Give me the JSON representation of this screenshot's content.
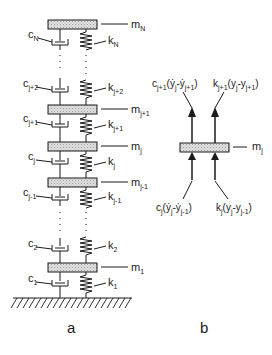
{
  "figure": {
    "panel_a": {
      "caption": "a",
      "masses": [
        {
          "base": "m",
          "sub": "N"
        },
        {
          "base": "m",
          "sub": "j+1"
        },
        {
          "base": "m",
          "sub": "j"
        },
        {
          "base": "m",
          "sub": "j-1"
        },
        {
          "base": "m",
          "sub": "1"
        }
      ],
      "dampers": [
        {
          "base": "c",
          "sub": "N"
        },
        {
          "base": "c",
          "sub": "j+2"
        },
        {
          "base": "c",
          "sub": "j+1"
        },
        {
          "base": "c",
          "sub": "j"
        },
        {
          "base": "c",
          "sub": "j-1"
        },
        {
          "base": "c",
          "sub": "2"
        },
        {
          "base": "c",
          "sub": "1"
        }
      ],
      "springs": [
        {
          "base": "k",
          "sub": "N"
        },
        {
          "base": "k",
          "sub": "j+2"
        },
        {
          "base": "k",
          "sub": "j+1"
        },
        {
          "base": "k",
          "sub": "j"
        },
        {
          "base": "k",
          "sub": "j-1"
        },
        {
          "base": "k",
          "sub": "2"
        },
        {
          "base": "k",
          "sub": "1"
        }
      ],
      "ground": "fixed-ground-hatch"
    },
    "panel_b": {
      "caption": "b",
      "mass": {
        "base": "m",
        "sub": "j"
      },
      "forces_top": [
        {
          "coef": "c",
          "coef_sub": "j+1",
          "expr": "(ẏ",
          "s1": "j",
          "mid": "-ẏ",
          "s2": "j+1",
          "end": ")"
        },
        {
          "coef": "k",
          "coef_sub": "j+1",
          "expr": "(y",
          "s1": "j",
          "mid": "-y",
          "s2": "j+1",
          "end": ")"
        }
      ],
      "forces_bottom": [
        {
          "coef": "c",
          "coef_sub": "j",
          "expr": "(ẏ",
          "s1": "j",
          "mid": "-ẏ",
          "s2": "j-1",
          "end": ")"
        },
        {
          "coef": "k",
          "coef_sub": "j",
          "expr": "(y",
          "s1": "j",
          "mid": "-y",
          "s2": "j-1",
          "end": ")"
        }
      ]
    },
    "colors": {
      "line": "#1a1a1a",
      "mass_fill": "#d6d6d6",
      "background": "#ffffff"
    }
  }
}
